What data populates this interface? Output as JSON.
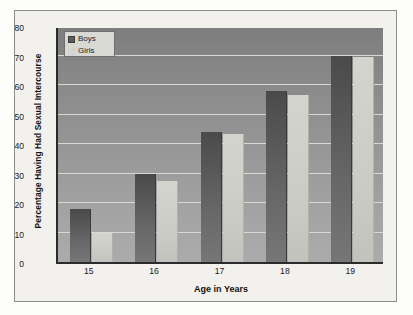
{
  "chart_data": {
    "type": "bar",
    "title": "",
    "xlabel": "Age in Years",
    "ylabel": "Percentage Having Had Sexual Intercourse",
    "categories": [
      "15",
      "16",
      "17",
      "18",
      "19"
    ],
    "series": [
      {
        "name": "Boys",
        "values": [
          18,
          30,
          44,
          58,
          70
        ],
        "color": "#5b5b5b"
      },
      {
        "name": "Girls",
        "values": [
          10,
          27.5,
          43.5,
          56.5,
          69.5
        ],
        "color": "#d7d7d2"
      }
    ],
    "ylim": [
      0,
      80
    ],
    "yticks": [
      0,
      10,
      20,
      30,
      40,
      50,
      60,
      70,
      80
    ],
    "ytick_labels": [
      "0",
      "10",
      "20",
      "30",
      "40",
      "50",
      "60",
      "70",
      "80"
    ],
    "grid": true,
    "grid_axis": "y",
    "legend_position": "top-left",
    "legend_entries": [
      "Boys",
      "Girls"
    ],
    "plot_background": "#909090",
    "figure_background": "#f2f1ee"
  }
}
